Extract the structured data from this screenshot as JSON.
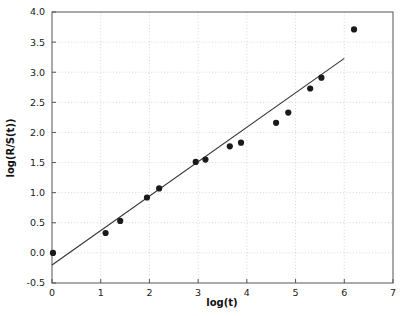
{
  "chart_data": {
    "type": "scatter",
    "title": "",
    "xlabel": "log(t)",
    "ylabel": "log(R/S(t))",
    "xlim": [
      0,
      7
    ],
    "ylim": [
      -0.5,
      4.0
    ],
    "xticks": [
      0,
      1,
      2,
      3,
      4,
      5,
      6,
      7
    ],
    "xticklabels": [
      "0",
      "1",
      "2",
      "3",
      "4",
      "5",
      "6",
      "7"
    ],
    "yticks": [
      -0.5,
      0.0,
      0.5,
      1.0,
      1.5,
      2.0,
      2.5,
      3.0,
      3.5,
      4.0
    ],
    "yticklabels": [
      "-0.5",
      "0.0",
      "0.5",
      "1.0",
      "1.5",
      "2.0",
      "2.5",
      "3.0",
      "3.5",
      "4.0"
    ],
    "grid": true,
    "grid_style": "dotted",
    "grid_color": "#cccccc",
    "legend": null,
    "marker_color": "#1a1a1a",
    "marker_size": 5,
    "line_color": "#333333",
    "series": [
      {
        "name": "R/S data points",
        "type": "scatter",
        "points": [
          {
            "x": 0.02,
            "y": 0.0
          },
          {
            "x": 1.1,
            "y": 0.33
          },
          {
            "x": 1.4,
            "y": 0.53
          },
          {
            "x": 1.95,
            "y": 0.92
          },
          {
            "x": 2.2,
            "y": 1.07
          },
          {
            "x": 2.95,
            "y": 1.51
          },
          {
            "x": 3.15,
            "y": 1.55
          },
          {
            "x": 3.65,
            "y": 1.77
          },
          {
            "x": 3.88,
            "y": 1.83
          },
          {
            "x": 4.6,
            "y": 2.16
          },
          {
            "x": 4.85,
            "y": 2.33
          },
          {
            "x": 5.3,
            "y": 2.73
          },
          {
            "x": 5.53,
            "y": 2.91
          },
          {
            "x": 6.2,
            "y": 3.71
          }
        ]
      },
      {
        "name": "linear fit",
        "type": "line",
        "slope": 0.572,
        "intercept": -0.2,
        "x_start": 0.0,
        "y_start": -0.2,
        "x_end": 6.0,
        "y_end": 3.23
      }
    ]
  }
}
